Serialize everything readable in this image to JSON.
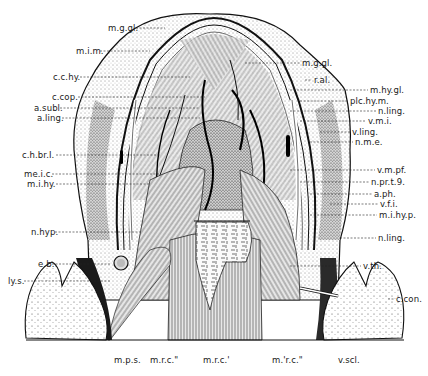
{
  "figure": {
    "labels_left": [
      {
        "id": "m-g-gl-left",
        "text": "m.g.gl.",
        "x": 108,
        "y": 24
      },
      {
        "id": "m-i-m",
        "text": "m.i.m.",
        "x": 76,
        "y": 47
      },
      {
        "id": "c-c-hy",
        "text": "c.c.hy.",
        "x": 53,
        "y": 73
      },
      {
        "id": "c-cop",
        "text": "c.cop.",
        "x": 52,
        "y": 93
      },
      {
        "id": "a-subl",
        "text": "a.subl.",
        "x": 34,
        "y": 104
      },
      {
        "id": "a-ling-left",
        "text": "a.ling.",
        "x": 37,
        "y": 114
      },
      {
        "id": "c-h-br-I",
        "text": "c.h.br.I.",
        "x": 22,
        "y": 151
      },
      {
        "id": "me-i-c",
        "text": "me.i.c.",
        "x": 24,
        "y": 170
      },
      {
        "id": "m-i-hy",
        "text": "m.i.hy.",
        "x": 27,
        "y": 180
      },
      {
        "id": "n-hyp",
        "text": "n.hyp.",
        "x": 31,
        "y": 228
      },
      {
        "id": "e-b",
        "text": "e.b.",
        "x": 38,
        "y": 260
      },
      {
        "id": "ly-s",
        "text": "ly.s.",
        "x": 8,
        "y": 277
      }
    ],
    "labels_right": [
      {
        "id": "m-g-gl-right",
        "text": "m.g.gl.",
        "x": 302,
        "y": 59
      },
      {
        "id": "r-al",
        "text": "r.al.",
        "x": 314,
        "y": 76
      },
      {
        "id": "m-hy-gl",
        "text": "m.hy.gl.",
        "x": 370,
        "y": 86
      },
      {
        "id": "plc-hy-m",
        "text": "plc.hy.m.",
        "x": 350,
        "y": 97
      },
      {
        "id": "n-ling-right-top",
        "text": "n.ling.",
        "x": 378,
        "y": 107
      },
      {
        "id": "v-m-i",
        "text": "v.m.i.",
        "x": 368,
        "y": 117
      },
      {
        "id": "v-ling",
        "text": "v.ling.",
        "x": 352,
        "y": 128
      },
      {
        "id": "n-m-e",
        "text": "n.m.e.",
        "x": 355,
        "y": 138
      },
      {
        "id": "v-m-pf",
        "text": "v.m.pf.",
        "x": 377,
        "y": 166
      },
      {
        "id": "n-pr-t-9",
        "text": "n.pr.t.9.",
        "x": 371,
        "y": 178
      },
      {
        "id": "a-ph",
        "text": "a.ph.",
        "x": 374,
        "y": 190
      },
      {
        "id": "v-f-i",
        "text": "v.f.i.",
        "x": 380,
        "y": 200
      },
      {
        "id": "m-i-hy-p",
        "text": "m.i.hy.p.",
        "x": 379,
        "y": 211
      },
      {
        "id": "n-ling-right-bottom",
        "text": "n.ling.",
        "x": 378,
        "y": 234
      },
      {
        "id": "v-th",
        "text": "v.th.",
        "x": 363,
        "y": 262
      },
      {
        "id": "c-con",
        "text": "c.con.",
        "x": 396,
        "y": 295
      },
      {
        "id": "v-scl",
        "text": "v.scl.",
        "x": 338,
        "y": 356
      }
    ],
    "labels_bottom": [
      {
        "id": "m-p-s",
        "text": "m.p.s.",
        "x": 114,
        "y": 356
      },
      {
        "id": "m-r-c-2-left",
        "text": "m.r.c.\"",
        "x": 150,
        "y": 356
      },
      {
        "id": "m-r-c-1",
        "text": "m.r.c.'",
        "x": 203,
        "y": 356
      },
      {
        "id": "m-r-c-2-right",
        "text": "m.'r.c.\"",
        "x": 272,
        "y": 356
      }
    ]
  }
}
